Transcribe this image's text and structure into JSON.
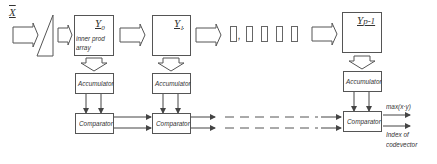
{
  "input": {
    "label": "X"
  },
  "codebook": [
    {
      "label": "Y0",
      "main": "Y",
      "sub": "0",
      "caption": [
        "inner prod",
        "array"
      ]
    },
    {
      "label": "Y1",
      "main": "Y",
      "sub": "1"
    },
    {
      "label": "Yp-1",
      "main": "Y",
      "sub": "p-1"
    }
  ],
  "ellipsis": {
    "comma": ","
  },
  "accumulators": [
    "Accumulator",
    "Accumulator",
    "Accumulator"
  ],
  "comparators": [
    "Comparator",
    "Comparator",
    "Comparator"
  ],
  "outputs": {
    "max": "max(x·y)",
    "index_line1": "Index of",
    "index_line2": "codevector"
  }
}
